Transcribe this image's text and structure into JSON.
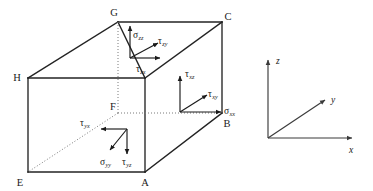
{
  "figure": {
    "background_color": "#ffffff",
    "line_color": "#232323",
    "hidden_line_color": "#7a7a7a",
    "text_color": "#1a1a1a"
  },
  "cube": {
    "vertices": [
      {
        "id": "A",
        "label": "A",
        "x": 145,
        "y": 172,
        "label_x": 142,
        "label_y": 184,
        "hidden": false
      },
      {
        "id": "B",
        "label": "B",
        "x": 222,
        "y": 113,
        "label_x": 224,
        "label_y": 127,
        "hidden": false
      },
      {
        "id": "C",
        "label": "C",
        "x": 222,
        "y": 22,
        "label_x": 225,
        "label_y": 20,
        "hidden": false
      },
      {
        "id": "E",
        "label": "E",
        "x": 28,
        "y": 172,
        "label_x": 19,
        "label_y": 184,
        "hidden": false
      },
      {
        "id": "F",
        "label": "F",
        "x": 118,
        "y": 113,
        "label_x": 111,
        "label_y": 111,
        "hidden": true
      },
      {
        "id": "G",
        "label": "G",
        "x": 118,
        "y": 22,
        "label_x": 114,
        "label_y": 16,
        "hidden": false
      },
      {
        "id": "H",
        "label": "H",
        "x": 28,
        "y": 78,
        "label_x": 17,
        "label_y": 80,
        "hidden": false
      }
    ],
    "solid_edges": [
      [
        "E",
        "A"
      ],
      [
        "A",
        "B"
      ],
      [
        "B",
        "C"
      ],
      [
        "C",
        "G"
      ],
      [
        "G",
        "H"
      ],
      [
        "H",
        "E"
      ],
      [
        "H",
        "GG_left"
      ],
      [
        "A",
        "AA_up"
      ],
      [
        "G",
        "GG_down"
      ]
    ],
    "hidden_edges": [
      [
        "G",
        "F"
      ],
      [
        "F",
        "B"
      ],
      [
        "F",
        "E"
      ]
    ]
  },
  "stress_groups": [
    {
      "name": "top-face-z",
      "face": "top",
      "origin_x": 130,
      "origin_y": 55,
      "components": [
        {
          "symbol": "σ",
          "sub": "zz",
          "name": "sigma-zz",
          "dir": "up",
          "label_x": 134,
          "label_y": 36
        },
        {
          "symbol": "τ",
          "sub": "zy",
          "name": "tau-zy",
          "dir": "up-right",
          "label_x": 156,
          "label_y": 45
        },
        {
          "symbol": "τ",
          "sub": "zx",
          "name": "tau-zx",
          "dir": "right",
          "label_x": 138,
          "label_y": 72
        }
      ]
    },
    {
      "name": "right-face-x",
      "face": "right",
      "origin_x": 180,
      "origin_y": 112,
      "components": [
        {
          "symbol": "τ",
          "sub": "xz",
          "name": "tau-xz",
          "dir": "up",
          "label_x": 185,
          "label_y": 77
        },
        {
          "symbol": "τ",
          "sub": "xy",
          "name": "tau-xy",
          "dir": "up-right",
          "label_x": 208,
          "label_y": 97
        },
        {
          "symbol": "σ",
          "sub": "xx",
          "name": "sigma-xx",
          "dir": "right",
          "label_x": 224,
          "label_y": 114
        }
      ]
    },
    {
      "name": "front-face-y",
      "face": "front",
      "origin_x": 127,
      "origin_y": 129,
      "components": [
        {
          "symbol": "τ",
          "sub": "yx",
          "name": "tau-yx",
          "dir": "left",
          "label_x": 82,
          "label_y": 126
        },
        {
          "symbol": "σ",
          "sub": "yy",
          "name": "sigma-yy",
          "dir": "down-left",
          "label_x": 104,
          "label_y": 163
        },
        {
          "symbol": "τ",
          "sub": "yz",
          "name": "tau-yz",
          "dir": "down",
          "label_x": 124,
          "label_y": 163
        }
      ]
    }
  ],
  "axis_triad": {
    "name": "coordinate-axes",
    "origin_x": 268,
    "origin_y": 138,
    "axes": [
      {
        "id": "z",
        "label": "z",
        "tip_x": 268,
        "tip_y": 60,
        "label_x": 275,
        "label_y": 64
      },
      {
        "id": "y",
        "label": "y",
        "tip_x": 325,
        "tip_y": 100,
        "label_x": 331,
        "label_y": 103
      },
      {
        "id": "x",
        "label": "x",
        "tip_x": 352,
        "tip_y": 138,
        "label_x": 350,
        "label_y": 152
      }
    ]
  }
}
